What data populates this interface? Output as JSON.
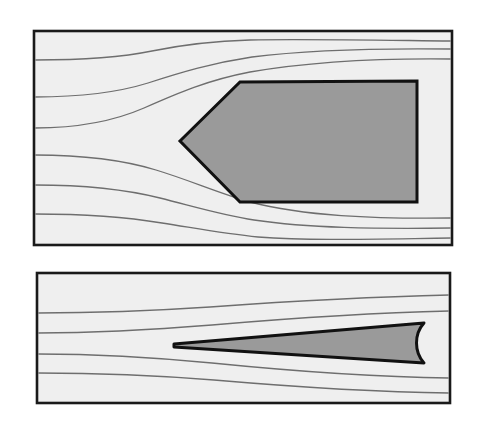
{
  "figure": {
    "background_color": "#ffffff",
    "panel_fill": "#efefef",
    "panel_border_color": "#1a1a1a",
    "body_fill": "#9a9a9a",
    "body_outline_color": "#111111",
    "streamline_color": "#6e6e6e",
    "streamline_width": 1.3
  },
  "chart_data": {
    "type": "line",
    "subtitle": "",
    "xlabel": "",
    "ylabel": "",
    "grid": false,
    "legend": null,
    "panels": [
      {
        "name": "upper-panel",
        "label": "Blunt hexagonal body",
        "frame": {
          "x": 34,
          "y": 31,
          "width": 418,
          "height": 214
        },
        "body": {
          "name": "hexagon-body",
          "shape": "hexagon",
          "fill": "#9a9a9a",
          "stroke": "#111111",
          "stroke_width": 3,
          "points": "180,141 240,82 417,81 417,202 240,202 180,141"
        },
        "streamlines": [
          {
            "id": "u1",
            "inlet_y": 60,
            "outlet_y": 41,
            "path": "M34,60 C80,60 118,58 152,51 C186,44 214,41 250,40 C300,39 360,40 452,41"
          },
          {
            "id": "u2",
            "inlet_y": 97,
            "outlet_y": 49,
            "path": "M34,97 C80,97 116,93 148,83 C182,72 212,63 252,57 C306,50 370,48 452,49"
          },
          {
            "id": "u3",
            "inlet_y": 128,
            "outlet_y": 59,
            "path": "M34,128 C78,128 112,122 144,108 C178,93 208,80 250,72 C308,62 372,58 452,59"
          },
          {
            "id": "u4",
            "inlet_y": 155,
            "outlet_y": 218,
            "path": "M34,155 C82,155 120,159 156,170 C192,181 218,193 250,202 C304,216 372,219 452,218"
          },
          {
            "id": "u5",
            "inlet_y": 185,
            "outlet_y": 228,
            "path": "M34,185 C84,185 124,189 160,198 C196,207 222,215 254,220 C308,228 374,229 452,228"
          },
          {
            "id": "u6",
            "inlet_y": 214,
            "outlet_y": 238,
            "path": "M34,214 C86,214 126,217 162,223 C200,229 226,234 258,237 C312,241 376,239 452,238"
          }
        ]
      },
      {
        "name": "lower-panel",
        "label": "Slender wedge body",
        "frame": {
          "x": 37,
          "y": 273,
          "width": 413,
          "height": 130
        },
        "body": {
          "name": "wedge-body",
          "shape": "wedge",
          "fill": "#9a9a9a",
          "stroke": "#111111",
          "stroke_width": 3,
          "path": "M174,344 L424,323 C414,334 414,352 424,363 L174,347 Z"
        },
        "streamlines": [
          {
            "id": "l1",
            "inlet_y": 313,
            "outlet_y": 295,
            "path": "M37,313 C100,313 150,311 210,307 C280,302 360,297 450,295"
          },
          {
            "id": "l2",
            "inlet_y": 333,
            "outlet_y": 311,
            "path": "M37,333 C100,333 150,330 212,325 C282,319 362,313 450,311"
          },
          {
            "id": "l3",
            "inlet_y": 354,
            "outlet_y": 378,
            "path": "M37,354 C100,354 150,357 212,363 C282,370 362,377 450,378"
          },
          {
            "id": "l4",
            "inlet_y": 373,
            "outlet_y": 393,
            "path": "M37,373 C100,373 152,375 214,380 C284,386 364,392 450,393"
          }
        ]
      }
    ]
  }
}
